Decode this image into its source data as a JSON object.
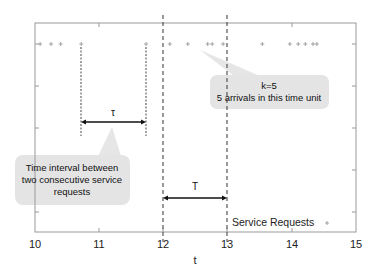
{
  "chart_data": {
    "type": "scatter",
    "title": "",
    "xlabel": "t",
    "ylabel": "",
    "xlim": [
      10,
      15
    ],
    "xticks": [
      "10",
      "11",
      "12",
      "13",
      "14",
      "15"
    ],
    "grid": false,
    "legend": {
      "position": "lower right",
      "entries": [
        "Service Requests"
      ]
    },
    "series": [
      {
        "name": "Service Requests",
        "marker": "+",
        "color": "#9a9a9a",
        "x": [
          10.08,
          10.25,
          10.4,
          10.72,
          11.73,
          12.1,
          12.38,
          12.69,
          12.76,
          12.93,
          13.54,
          13.97,
          14.1,
          14.21,
          14.33,
          14.39
        ]
      }
    ],
    "vertical_lines": [
      {
        "x": 10.72,
        "style": "dotted",
        "purpose": "tau-start"
      },
      {
        "x": 11.73,
        "style": "dotted",
        "purpose": "tau-end"
      },
      {
        "x": 12.0,
        "style": "dashed",
        "purpose": "T-start"
      },
      {
        "x": 13.0,
        "style": "dashed",
        "purpose": "T-end"
      }
    ],
    "annotations": [
      {
        "label": "τ",
        "type": "double-arrow",
        "from": 10.72,
        "to": 11.73
      },
      {
        "label": "T",
        "type": "double-arrow",
        "from": 12.0,
        "to": 13.0
      },
      {
        "type": "callout",
        "text": [
          "Time interval between",
          "two consecutive service",
          "requests"
        ],
        "points_to": "τ"
      },
      {
        "type": "callout",
        "text": [
          "k=5",
          "5 arrivals in this time unit"
        ],
        "points_to": "arrivals in [12,13]"
      }
    ]
  },
  "labels": {
    "xlabel": "t",
    "xticks": [
      "10",
      "11",
      "12",
      "13",
      "14",
      "15"
    ],
    "tau": "τ",
    "T": "T",
    "callout_left": [
      "Time interval between",
      "two consecutive service",
      "requests"
    ],
    "callout_right": [
      "k=5",
      "5 arrivals in this time unit"
    ],
    "legend_label": "Service Requests"
  },
  "colors": {
    "frame": "#9a9a9a",
    "marker": "#9a9a9a",
    "dashed_line": "#555555",
    "callout_fill": "#e4e4e4",
    "arrow": "#111111"
  }
}
